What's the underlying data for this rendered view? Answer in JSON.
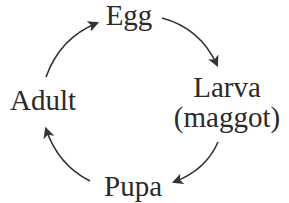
{
  "diagram": {
    "type": "cycle",
    "title": "",
    "stages": [
      {
        "id": "egg",
        "label": "Egg"
      },
      {
        "id": "larva",
        "label": "Larva",
        "sublabel": "(maggot)"
      },
      {
        "id": "pupa",
        "label": "Pupa"
      },
      {
        "id": "adult",
        "label": "Adult"
      }
    ],
    "edges": [
      {
        "from": "egg",
        "to": "larva"
      },
      {
        "from": "larva",
        "to": "pupa"
      },
      {
        "from": "pupa",
        "to": "adult"
      },
      {
        "from": "adult",
        "to": "egg"
      }
    ],
    "colors": {
      "text": "#2a2a2a",
      "arrow": "#333333",
      "background": "#ffffff"
    }
  }
}
